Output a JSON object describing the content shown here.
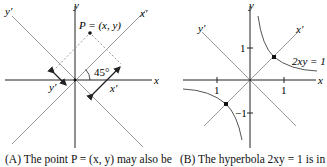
{
  "panelA": {
    "axis_x": "x",
    "axis_y": "y",
    "axis_xprime": "x′",
    "axis_yprime": "y′",
    "point_label": "P = (x, y)",
    "angle_label": "45°",
    "seg_xprime": "x′",
    "seg_yprime": "y′",
    "caption": "(A) The point P = (x, y) may also be"
  },
  "panelB": {
    "axis_x": "x",
    "axis_y": "y",
    "axis_xprime": "x′",
    "axis_yprime": "y′",
    "tick_x_pos": "1",
    "tick_x_neg": "1",
    "tick_y_pos": "1",
    "tick_y_neg": "−1",
    "curve_label": "2xy = 1",
    "caption": "(B) The hyperbola 2xy = 1 is in"
  },
  "colors": {
    "axis": "#222222",
    "rotated_axis": "#9a9a9a",
    "dashed": "#9a9a9a",
    "curve": "#555555"
  }
}
